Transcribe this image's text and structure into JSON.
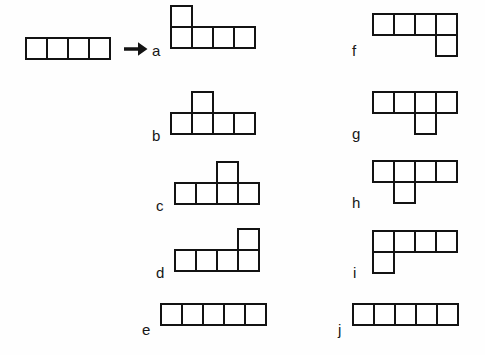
{
  "figure": {
    "background_color": "#fefefe",
    "stroke_color": "#131313",
    "fill_color": "#ffffff",
    "label_color": "#161616",
    "cell_size_px": 23,
    "stroke_width_px": 2
  },
  "source": {
    "name": "source-bar",
    "squares": 4,
    "x": 25,
    "y": 37,
    "cells": [
      {
        "col": 0,
        "row": 0
      },
      {
        "col": 1,
        "row": 0
      },
      {
        "col": 2,
        "row": 0
      },
      {
        "col": 3,
        "row": 0
      }
    ]
  },
  "arrow": {
    "name": "arrow-right-icon",
    "glyph": "→",
    "x": 124,
    "y": 40,
    "width": 24,
    "height": 18
  },
  "shapes": [
    {
      "label": "a",
      "label_x": 152,
      "label_y": 43,
      "origin_x": 170,
      "origin_y": 5,
      "base_row": 1,
      "base_length": 4,
      "extra_col": 0,
      "extra_row": 0,
      "extra_position": "above",
      "extra_index": 1,
      "cells": [
        {
          "col": 0,
          "row": 0
        },
        {
          "col": 0,
          "row": 1
        },
        {
          "col": 1,
          "row": 1
        },
        {
          "col": 2,
          "row": 1
        },
        {
          "col": 3,
          "row": 1
        }
      ]
    },
    {
      "label": "b",
      "label_x": 152,
      "label_y": 128,
      "origin_x": 170,
      "origin_y": 91,
      "base_row": 1,
      "base_length": 4,
      "extra_col": 1,
      "extra_row": 0,
      "extra_position": "above",
      "extra_index": 2,
      "cells": [
        {
          "col": 1,
          "row": 0
        },
        {
          "col": 0,
          "row": 1
        },
        {
          "col": 1,
          "row": 1
        },
        {
          "col": 2,
          "row": 1
        },
        {
          "col": 3,
          "row": 1
        }
      ]
    },
    {
      "label": "c",
      "label_x": 156,
      "label_y": 198,
      "origin_x": 174,
      "origin_y": 161,
      "base_row": 1,
      "base_length": 4,
      "extra_col": 2,
      "extra_row": 0,
      "extra_position": "above",
      "extra_index": 3,
      "cells": [
        {
          "col": 2,
          "row": 0
        },
        {
          "col": 0,
          "row": 1
        },
        {
          "col": 1,
          "row": 1
        },
        {
          "col": 2,
          "row": 1
        },
        {
          "col": 3,
          "row": 1
        }
      ]
    },
    {
      "label": "d",
      "label_x": 156,
      "label_y": 265,
      "origin_x": 174,
      "origin_y": 228,
      "base_row": 1,
      "base_length": 4,
      "extra_col": 3,
      "extra_row": 0,
      "extra_position": "above",
      "extra_index": 4,
      "cells": [
        {
          "col": 3,
          "row": 0
        },
        {
          "col": 0,
          "row": 1
        },
        {
          "col": 1,
          "row": 1
        },
        {
          "col": 2,
          "row": 1
        },
        {
          "col": 3,
          "row": 1
        }
      ]
    },
    {
      "label": "e",
      "label_x": 142,
      "label_y": 322,
      "origin_x": 160,
      "origin_y": 303,
      "base_row": 0,
      "base_length": 5,
      "extra_col": null,
      "extra_row": null,
      "extra_position": "none",
      "extra_index": 0,
      "cells": [
        {
          "col": 0,
          "row": 0
        },
        {
          "col": 1,
          "row": 0
        },
        {
          "col": 2,
          "row": 0
        },
        {
          "col": 3,
          "row": 0
        },
        {
          "col": 4,
          "row": 0
        }
      ]
    },
    {
      "label": "f",
      "label_x": 352,
      "label_y": 43,
      "origin_x": 372,
      "origin_y": 13,
      "base_row": 0,
      "base_length": 4,
      "extra_col": 3,
      "extra_row": 1,
      "extra_position": "below",
      "extra_index": 4,
      "cells": [
        {
          "col": 0,
          "row": 0
        },
        {
          "col": 1,
          "row": 0
        },
        {
          "col": 2,
          "row": 0
        },
        {
          "col": 3,
          "row": 0
        },
        {
          "col": 3,
          "row": 1
        }
      ]
    },
    {
      "label": "g",
      "label_x": 352,
      "label_y": 126,
      "origin_x": 372,
      "origin_y": 91,
      "base_row": 0,
      "base_length": 4,
      "extra_col": 2,
      "extra_row": 1,
      "extra_position": "below",
      "extra_index": 3,
      "cells": [
        {
          "col": 0,
          "row": 0
        },
        {
          "col": 1,
          "row": 0
        },
        {
          "col": 2,
          "row": 0
        },
        {
          "col": 3,
          "row": 0
        },
        {
          "col": 2,
          "row": 1
        }
      ]
    },
    {
      "label": "h",
      "label_x": 352,
      "label_y": 195,
      "origin_x": 372,
      "origin_y": 160,
      "base_row": 0,
      "base_length": 4,
      "extra_col": 1,
      "extra_row": 1,
      "extra_position": "below",
      "extra_index": 2,
      "cells": [
        {
          "col": 0,
          "row": 0
        },
        {
          "col": 1,
          "row": 0
        },
        {
          "col": 2,
          "row": 0
        },
        {
          "col": 3,
          "row": 0
        },
        {
          "col": 1,
          "row": 1
        }
      ]
    },
    {
      "label": "i",
      "label_x": 353,
      "label_y": 265,
      "origin_x": 372,
      "origin_y": 230,
      "base_row": 0,
      "base_length": 4,
      "extra_col": 0,
      "extra_row": 1,
      "extra_position": "below",
      "extra_index": 1,
      "cells": [
        {
          "col": 0,
          "row": 0
        },
        {
          "col": 1,
          "row": 0
        },
        {
          "col": 2,
          "row": 0
        },
        {
          "col": 3,
          "row": 0
        },
        {
          "col": 0,
          "row": 1
        }
      ]
    },
    {
      "label": "j",
      "label_x": 338,
      "label_y": 322,
      "origin_x": 352,
      "origin_y": 303,
      "base_row": 0,
      "base_length": 5,
      "extra_col": null,
      "extra_row": null,
      "extra_position": "none",
      "extra_index": 0,
      "cells": [
        {
          "col": 0,
          "row": 0
        },
        {
          "col": 1,
          "row": 0
        },
        {
          "col": 2,
          "row": 0
        },
        {
          "col": 3,
          "row": 0
        },
        {
          "col": 4,
          "row": 0
        }
      ]
    }
  ]
}
